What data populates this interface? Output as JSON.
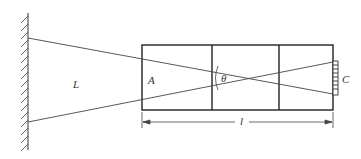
{
  "diagram": {
    "labels": {
      "L": "L",
      "A": "A",
      "theta": "θ",
      "C": "C",
      "l": "l"
    },
    "colors": {
      "line": "#333333",
      "background": "#ffffff"
    }
  }
}
